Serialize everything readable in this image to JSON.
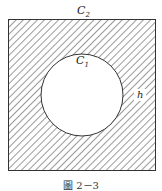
{
  "figure": {
    "outer_label": "C",
    "outer_sub": "2",
    "inner_label": "C",
    "inner_sub": "1",
    "gap_label": "h",
    "caption": "圖 2－3",
    "colors": {
      "stroke": "#333333",
      "hatch": "#555555",
      "background": "#ffffff"
    }
  }
}
